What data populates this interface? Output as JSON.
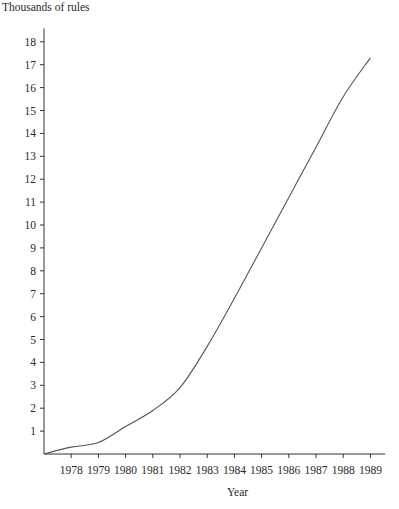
{
  "chart_data": {
    "type": "line",
    "title": "",
    "ylabel": "Thousands of rules",
    "xlabel": "Year",
    "x": [
      1977,
      1978,
      1979,
      1980,
      1981,
      1982,
      1983,
      1984,
      1985,
      1986,
      1987,
      1988,
      1989
    ],
    "series": [
      {
        "name": "Rules",
        "values": [
          0,
          0.3,
          0.5,
          1.2,
          1.9,
          2.9,
          4.7,
          6.8,
          9.0,
          11.2,
          13.4,
          15.6,
          17.3
        ]
      }
    ],
    "x_ticks": [
      "1978",
      "1979",
      "1980",
      "1981",
      "1982",
      "1983",
      "1984",
      "1985",
      "1986",
      "1987",
      "1988",
      "1989"
    ],
    "y_ticks": [
      "1",
      "2",
      "3",
      "4",
      "5",
      "6",
      "7",
      "8",
      "9",
      "10",
      "11",
      "12",
      "13",
      "14",
      "15",
      "16",
      "17",
      "18"
    ],
    "xlim": [
      1977,
      1989.5
    ],
    "ylim": [
      0,
      18.5
    ],
    "grid": false,
    "legend": "none",
    "line_color": "#555555",
    "axis_color": "#333333"
  }
}
